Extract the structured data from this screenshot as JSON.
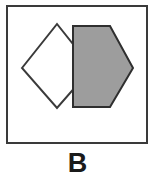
{
  "figure": {
    "caption": "B",
    "panel": {
      "background_color": "#ffffff",
      "width": 155,
      "height": 180
    },
    "frame": {
      "name": "panel-border",
      "stroke_color": "#3a3a3a",
      "stroke_width": 2,
      "x": 6,
      "y": 5,
      "width": 142,
      "height": 139,
      "fill_color": "#ffffff"
    },
    "shapes": [
      {
        "name": "diamond",
        "label": "white-diamond",
        "type": "polygon",
        "sides": 4,
        "fill_color": "#ffffff",
        "stroke_color": "#3a3a3a",
        "stroke_width": 2,
        "z_order": 1,
        "points": "22,68 57,24 92,68 57,108",
        "vertices": [
          {
            "x": 22,
            "y": 68
          },
          {
            "x": 57,
            "y": 24
          },
          {
            "x": 92,
            "y": 68
          },
          {
            "x": 57,
            "y": 108
          }
        ]
      },
      {
        "name": "pentagon",
        "label": "gray-pentagon",
        "type": "polygon",
        "sides": 5,
        "fill_color": "#9d9d9d",
        "stroke_color": "#2f2f2f",
        "stroke_width": 2,
        "z_order": 2,
        "points": "73,26 110,26 133,68 110,107 73,107",
        "vertices": [
          {
            "x": 73,
            "y": 26
          },
          {
            "x": 110,
            "y": 26
          },
          {
            "x": 133,
            "y": 68
          },
          {
            "x": 110,
            "y": 107
          },
          {
            "x": 73,
            "y": 107
          }
        ]
      }
    ],
    "colors": {
      "ink": "#3a3a3a",
      "gray_fill": "#9d9d9d",
      "paper": "#ffffff",
      "caption_color": "#1a1a1a"
    }
  }
}
